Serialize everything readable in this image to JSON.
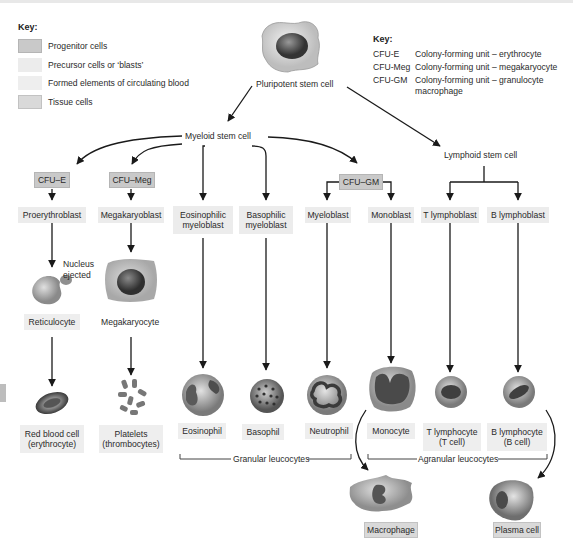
{
  "key_left": {
    "title": "Key:",
    "items": [
      {
        "label": "Progenitor cells",
        "swatch": "#c9c9c9"
      },
      {
        "label": "Precursor cells or ‘blasts’",
        "swatch": "#ececec"
      },
      {
        "label": "Formed elements of circulating blood",
        "swatch": "#eeeeee"
      },
      {
        "label": "Tissue cells",
        "swatch": "#d9d9d9"
      }
    ]
  },
  "key_right": {
    "title": "Key:",
    "items": [
      {
        "abbr": "CFU-E",
        "desc": "Colony-forming unit – erythrocyte"
      },
      {
        "abbr": "CFU-Meg",
        "desc": "Colony-forming unit – megakaryocyte"
      },
      {
        "abbr": "CFU-GM",
        "desc": "Colony-forming unit – granulocyte",
        "desc2": "macrophage"
      }
    ]
  },
  "stem": {
    "pluripotent": "Pluripotent stem cell",
    "myeloid": "Myeloid stem cell",
    "lymphoid": "Lymphoid stem cell"
  },
  "progenitors": {
    "cfu_e": "CFU–E",
    "cfu_meg": "CFU–Meg",
    "cfu_gm": "CFU–GM"
  },
  "precursors": {
    "proerythroblast": "Proerythroblast",
    "megakaryoblast": "Megakaryoblast",
    "eosinophilic_1": "Eosinophilic",
    "eosinophilic_2": "myeloblast",
    "basophilic_1": "Basophilic",
    "basophilic_2": "myeloblast",
    "myeloblast": "Myeloblast",
    "monoblast": "Monoblast",
    "t_lymphoblast": "T lymphoblast",
    "b_lymphoblast": "B lymphoblast"
  },
  "intermediates": {
    "nucleus_ejected_1": "Nucleus",
    "nucleus_ejected_2": "ejected",
    "reticulocyte": "Reticulocyte",
    "megakaryocyte": "Megakaryocyte"
  },
  "formed": {
    "rbc_1": "Red blood cell",
    "rbc_2": "(erythrocyte)",
    "platelets_1": "Platelets",
    "platelets_2": "(thrombocytes)",
    "eosinophil": "Eosinophil",
    "basophil": "Basophil",
    "neutrophil": "Neutrophil",
    "monocyte": "Monocyte",
    "t_lymph_1": "T lymphocyte",
    "t_lymph_2": "(T cell)",
    "b_lymph_1": "B lymphocyte",
    "b_lymph_2": "(B cell)"
  },
  "groups": {
    "granular": "Granular leucocytes",
    "agranular": "Agranular leucocytes"
  },
  "tissue": {
    "macrophage": "Macrophage",
    "plasma_cell": "Plasma cell"
  },
  "colors": {
    "line": "#1a1a1a",
    "progenitor_box": "#c9c9c9",
    "precursor_box": "#ececec",
    "formed_box": "#eeeeee",
    "tissue_box": "#d9d9d9"
  }
}
